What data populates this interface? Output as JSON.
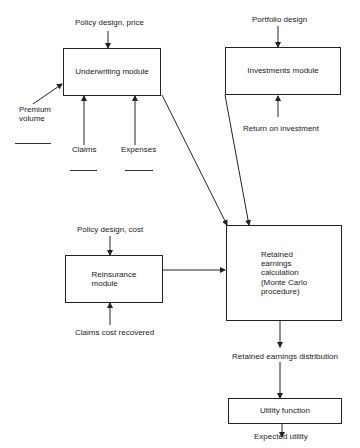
{
  "diagram": {
    "nodes": {
      "underwriting": "Underwriting module",
      "investments": "Investments module",
      "reinsurance": "Reinsurance\nmodule",
      "retained": "Retained\nearnings\ncalculation\n(Monte Carlo\nprocedure)",
      "utility": "Utility function"
    },
    "labels": {
      "policy_price": "Policy design, price",
      "portfolio": "Portfolio design",
      "premium": "Premium\nvolume",
      "claims": "Claims",
      "expenses": "Expenses",
      "roi": "Return on investment",
      "policy_cost": "Policy design, cost",
      "claims_recovered": "Claims cost recovered",
      "red": "Retained earnings distribution",
      "expected": "Expected utility"
    }
  }
}
